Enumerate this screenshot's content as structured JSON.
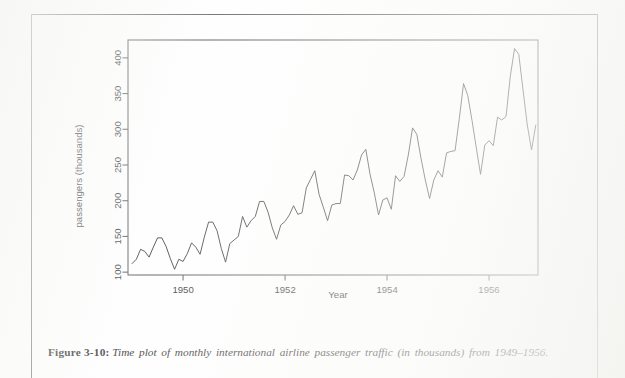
{
  "page": {
    "caption_label": "Figure 3-10",
    "caption_separator": ":",
    "caption_text": "Time plot of monthly international airline passenger traffic (in thousands) from 1949–1956."
  },
  "chart_data": {
    "type": "line",
    "title": "",
    "subtitle": "",
    "xlabel": "Year",
    "ylabel": "passengers (thousands)",
    "xlim": [
      1948.92,
      1956.96
    ],
    "ylim": [
      96,
      425
    ],
    "xticks": [
      1950,
      1952,
      1954,
      1956
    ],
    "xticklabels": [
      "1950",
      "1952",
      "1954",
      "1956"
    ],
    "yticks": [
      100,
      150,
      200,
      250,
      300,
      350,
      400
    ],
    "yticklabels": [
      "100",
      "150",
      "200",
      "250",
      "300",
      "350",
      "400"
    ],
    "grid": false,
    "legend": null,
    "legend_position": "none",
    "line_color": "#2b2b2b",
    "frame_color": "#555555",
    "series": [
      {
        "name": "monthly international airline passengers (thousands)",
        "x": [
          1949.0,
          1949.0833,
          1949.1667,
          1949.25,
          1949.3333,
          1949.4167,
          1949.5,
          1949.5833,
          1949.6667,
          1949.75,
          1949.8333,
          1949.9167,
          1950.0,
          1950.0833,
          1950.1667,
          1950.25,
          1950.3333,
          1950.4167,
          1950.5,
          1950.5833,
          1950.6667,
          1950.75,
          1950.8333,
          1950.9167,
          1951.0,
          1951.0833,
          1951.1667,
          1951.25,
          1951.3333,
          1951.4167,
          1951.5,
          1951.5833,
          1951.6667,
          1951.75,
          1951.8333,
          1951.9167,
          1952.0,
          1952.0833,
          1952.1667,
          1952.25,
          1952.3333,
          1952.4167,
          1952.5,
          1952.5833,
          1952.6667,
          1952.75,
          1952.8333,
          1952.9167,
          1953.0,
          1953.0833,
          1953.1667,
          1953.25,
          1953.3333,
          1953.4167,
          1953.5,
          1953.5833,
          1953.6667,
          1953.75,
          1953.8333,
          1953.9167,
          1954.0,
          1954.0833,
          1954.1667,
          1954.25,
          1954.3333,
          1954.4167,
          1954.5,
          1954.5833,
          1954.6667,
          1954.75,
          1954.8333,
          1954.9167,
          1955.0,
          1955.0833,
          1955.1667,
          1955.25,
          1955.3333,
          1955.4167,
          1955.5,
          1955.5833,
          1955.6667,
          1955.75,
          1955.8333,
          1955.9167,
          1956.0,
          1956.0833,
          1956.1667,
          1956.25,
          1956.3333,
          1956.4167,
          1956.5,
          1956.5833,
          1956.6667,
          1956.75,
          1956.8333,
          1956.9167
        ],
        "values": [
          112,
          118,
          132,
          129,
          121,
          135,
          148,
          148,
          136,
          119,
          104,
          118,
          115,
          126,
          141,
          135,
          125,
          149,
          170,
          170,
          158,
          133,
          114,
          140,
          145,
          150,
          178,
          163,
          172,
          178,
          199,
          199,
          184,
          162,
          146,
          166,
          171,
          180,
          193,
          181,
          183,
          218,
          230,
          242,
          209,
          191,
          172,
          194,
          196,
          196,
          236,
          235,
          229,
          243,
          264,
          272,
          237,
          211,
          180,
          201,
          204,
          188,
          235,
          227,
          234,
          264,
          302,
          293,
          259,
          229,
          203,
          229,
          242,
          233,
          267,
          269,
          270,
          315,
          364,
          347,
          312,
          274,
          237,
          278,
          284,
          277,
          317,
          313,
          318,
          374,
          413,
          405,
          355,
          306,
          271,
          306
        ]
      }
    ]
  }
}
